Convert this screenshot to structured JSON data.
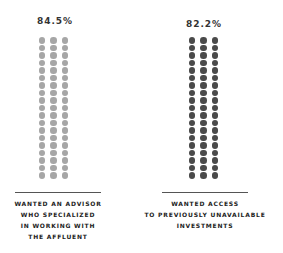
{
  "chart_data": {
    "type": "pictograph",
    "title": "",
    "series": [
      {
        "name": "Wanted an advisor who specialized in working with the affluent",
        "value": 84.5,
        "value_label": "84.5%",
        "dot_color": "#a6a6a6",
        "columns": 3,
        "rows": 19,
        "label_lines": [
          "WANTED AN ADVISOR",
          "WHO SPECIALIZED",
          "IN WORKING WITH",
          "THE AFFLUENT"
        ]
      },
      {
        "name": "Wanted access to previously unavailable investments",
        "value": 82.2,
        "value_label": "82.2%",
        "dot_color": "#4a4a4a",
        "columns": 3,
        "rows": 19,
        "label_lines": [
          "WANTED ACCESS",
          "TO PREVIOUSLY UNAVAILABLE",
          "INVESTMENTS"
        ]
      }
    ],
    "xlabel": "",
    "ylabel": "",
    "grid": false,
    "legend": "none"
  },
  "left": {
    "value_label": "84.5%",
    "label_lines": [
      "WANTED AN ADVISOR",
      "WHO SPECIALIZED",
      "IN WORKING WITH",
      "THE AFFLUENT"
    ]
  },
  "right": {
    "value_label": "82.2%",
    "label_lines": [
      "WANTED ACCESS",
      "TO PREVIOUSLY UNAVAILABLE",
      "INVESTMENTS"
    ]
  }
}
